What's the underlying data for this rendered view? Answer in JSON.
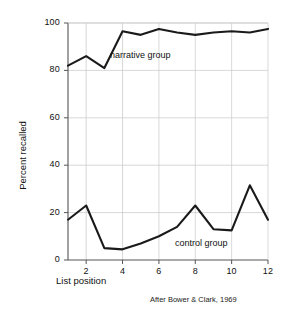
{
  "chart_data": {
    "type": "line",
    "title": "",
    "xlabel": "List position",
    "ylabel": "Percent recalled",
    "annotation": "After Bower & Clark, 1969",
    "x": [
      1,
      2,
      3,
      4,
      5,
      6,
      7,
      8,
      9,
      10,
      11,
      12
    ],
    "xlim": [
      1,
      12
    ],
    "ylim": [
      0,
      100
    ],
    "xticks": [
      "2",
      "4",
      "6",
      "8",
      "10",
      "12"
    ],
    "xtick_values": [
      2,
      4,
      6,
      8,
      10,
      12
    ],
    "yticks": [
      "0",
      "20",
      "40",
      "60",
      "80",
      "100"
    ],
    "ytick_values": [
      0,
      20,
      40,
      60,
      80,
      100
    ],
    "grid": true,
    "legend_position": "inline-annotations",
    "line_color": "#1a1a1a",
    "grid_color": "#c8c8c8",
    "axis_color": "#555555",
    "background": "#ffffff",
    "series": [
      {
        "name": "narrative group",
        "label": "narrative group",
        "values": [
          82,
          86,
          81,
          96.5,
          95,
          97.5,
          96,
          95,
          96,
          96.5,
          96,
          97.5
        ]
      },
      {
        "name": "control group",
        "label": "control group",
        "values": [
          17,
          23,
          5,
          4.5,
          7,
          10,
          14,
          23,
          13,
          12.5,
          31.5,
          17
        ]
      }
    ]
  }
}
